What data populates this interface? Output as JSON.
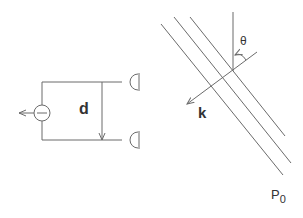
{
  "colors": {
    "stroke": "#6b6b6b",
    "text": "#333333",
    "background": "#ffffff"
  },
  "left_diagram": {
    "distance_label": "d",
    "source_symbol": "minus"
  },
  "right_diagram": {
    "angle_label": "θ",
    "wavevector_label": "k",
    "plane_label": "P",
    "plane_label_subscript": "0"
  }
}
